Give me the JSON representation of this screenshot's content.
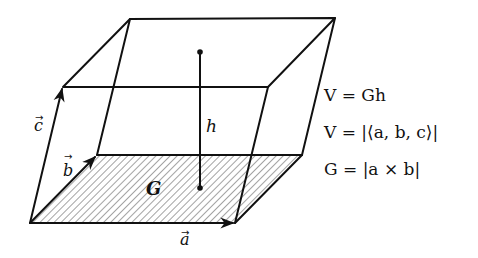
{
  "figure": {
    "labels": {
      "a": "a",
      "b": "b",
      "c": "c",
      "h": "h",
      "G": "G"
    },
    "equations": [
      "V = Gh",
      "V = |⟨a, b, c⟩|",
      "G = |a × b|"
    ],
    "colors": {
      "stroke": "#111111",
      "hatch": "#555555",
      "background": "#ffffff"
    }
  }
}
